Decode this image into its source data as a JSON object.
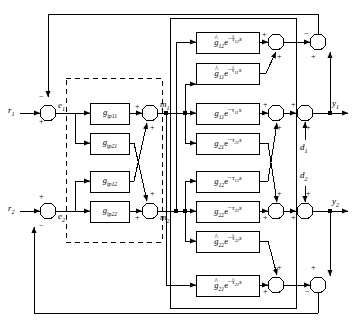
{
  "diagram": {
    "type": "block-diagram",
    "width": 354,
    "height": 326,
    "line_color": "#000000",
    "background": "#ffffff"
  },
  "inputs": [
    {
      "name": "r1",
      "base": "r",
      "sub": "1",
      "sign": "+"
    },
    {
      "name": "r2",
      "base": "r",
      "sub": "2",
      "sign": "+"
    }
  ],
  "errors": [
    {
      "name": "e1",
      "base": "e",
      "sub": "1"
    },
    {
      "name": "e2",
      "base": "e",
      "sub": "2"
    }
  ],
  "manipulated": [
    {
      "name": "m1",
      "base": "m",
      "sub": "1"
    },
    {
      "name": "m2",
      "base": "m",
      "sub": "2"
    }
  ],
  "outputs": [
    {
      "name": "y1",
      "base": "y",
      "sub": "1"
    },
    {
      "name": "y2",
      "base": "y",
      "sub": "2"
    }
  ],
  "disturbances": [
    {
      "name": "d1",
      "base": "d",
      "sub": "1",
      "sign": "+"
    },
    {
      "name": "d2",
      "base": "d",
      "sub": "2",
      "sign": "+"
    }
  ],
  "controller_blocks": [
    {
      "id": "gip11",
      "base": "g",
      "sub": "ip11",
      "hat": false,
      "label": "gip11"
    },
    {
      "id": "gip21",
      "base": "g",
      "sub": "ip21",
      "hat": false,
      "label": "gip21"
    },
    {
      "id": "gip12",
      "base": "g",
      "sub": "ip12",
      "hat": false,
      "label": "gip12"
    },
    {
      "id": "gip22",
      "base": "g",
      "sub": "ip22",
      "hat": false,
      "label": "gip22"
    }
  ],
  "process_blocks": [
    {
      "id": "ghat12",
      "gain_base": "g",
      "gain_sub": "12",
      "gain_hat": true,
      "tau_base": "τ",
      "tau_sub": "12",
      "tau_hat": true,
      "label": "ghat12 e^-tauhat12 s"
    },
    {
      "id": "ghat11",
      "gain_base": "g",
      "gain_sub": "11",
      "gain_hat": true,
      "tau_base": "τ",
      "tau_sub": "11",
      "tau_hat": true,
      "label": "ghat11 e^-tauhat11 s"
    },
    {
      "id": "g11",
      "gain_base": "g",
      "gain_sub": "11",
      "gain_hat": false,
      "tau_base": "τ",
      "tau_sub": "11",
      "tau_hat": false,
      "label": "g11 e^-tau11 s"
    },
    {
      "id": "g21",
      "gain_base": "g",
      "gain_sub": "21",
      "gain_hat": false,
      "tau_base": "τ",
      "tau_sub": "21",
      "tau_hat": false,
      "label": "g21 e^-tau21 s"
    },
    {
      "id": "g12",
      "gain_base": "g",
      "gain_sub": "12",
      "gain_hat": false,
      "tau_base": "τ",
      "tau_sub": "12",
      "tau_hat": false,
      "label": "g12 e^-tau12 s"
    },
    {
      "id": "g22",
      "gain_base": "g",
      "gain_sub": "22",
      "gain_hat": false,
      "tau_base": "τ",
      "tau_sub": "22",
      "tau_hat": false,
      "label": "g22 e^-tau22 s"
    },
    {
      "id": "ghat22",
      "gain_base": "g",
      "gain_sub": "22",
      "gain_hat": true,
      "tau_base": "τ",
      "tau_sub": "22",
      "tau_hat": true,
      "label": "ghat22 e^-tauhat22 s"
    },
    {
      "id": "ghat21",
      "gain_base": "g",
      "gain_sub": "21",
      "gain_hat": true,
      "tau_base": "τ",
      "tau_sub": "21",
      "tau_hat": true,
      "label": "ghat21 e^-tauhat21 s"
    }
  ],
  "exponent_prefix": "e",
  "exponent_minus": "−",
  "laplace_var": "s",
  "summing_signs": {
    "plus": "+",
    "minus": "−",
    "sum_r1": {
      "input": "+",
      "feedback": "−"
    },
    "sum_r2": {
      "input": "+",
      "feedback": "−"
    },
    "sum_m1": {
      "direct": "+",
      "cross": "+"
    },
    "sum_m2": {
      "direct": "+",
      "cross": "+"
    },
    "sum_top": {
      "left": "+",
      "cross": "+"
    },
    "sum_y1a": {
      "left": "+",
      "cross": "+"
    },
    "sum_y1b": {
      "left": "+",
      "dist": "+"
    },
    "sum_y1fb": {
      "left": "−",
      "top": "+"
    },
    "sum_y2a": {
      "left": "+",
      "cross": "+"
    },
    "sum_y2b": {
      "left": "+",
      "dist": "+"
    },
    "sum_bot": {
      "left": "+",
      "cross": "+"
    },
    "sum_y2fb": {
      "left": "−",
      "top": "+"
    }
  }
}
